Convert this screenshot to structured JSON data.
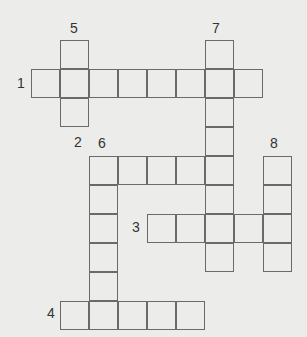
{
  "puzzle": {
    "cell_size": 29,
    "origin_x": 31,
    "origin_y": 40,
    "entries": [
      {
        "number": "1",
        "direction": "across",
        "row": 1,
        "col": 0,
        "length": 8
      },
      {
        "number": "2",
        "direction": "across",
        "row": 4,
        "col": 2,
        "length": 5
      },
      {
        "number": "3",
        "direction": "across",
        "row": 6,
        "col": 4,
        "length": 5
      },
      {
        "number": "4",
        "direction": "across",
        "row": 9,
        "col": 1,
        "length": 5
      },
      {
        "number": "5",
        "direction": "down",
        "row": 0,
        "col": 1,
        "length": 3
      },
      {
        "number": "6",
        "direction": "down",
        "row": 4,
        "col": 2,
        "length": 6
      },
      {
        "number": "7",
        "direction": "down",
        "row": 0,
        "col": 6,
        "length": 8
      },
      {
        "number": "8",
        "direction": "down",
        "row": 4,
        "col": 8,
        "length": 4
      }
    ]
  },
  "labels": {
    "n1": "1",
    "n2": "2",
    "n3": "3",
    "n4": "4",
    "n5": "5",
    "n6": "6",
    "n7": "7",
    "n8": "8"
  }
}
